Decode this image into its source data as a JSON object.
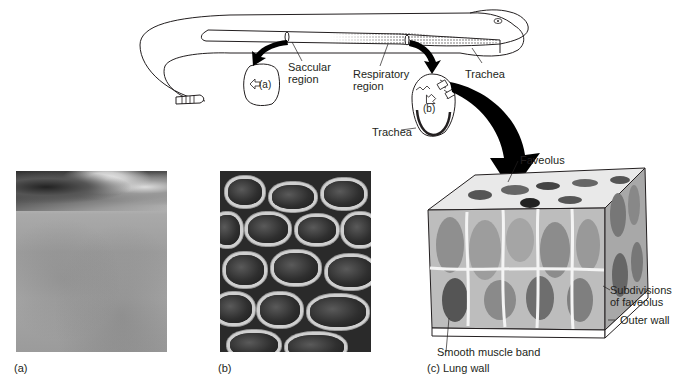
{
  "figure": {
    "top_diagram": {
      "labels": {
        "saccular_region": [
          "Saccular",
          "region"
        ],
        "respiratory_region": [
          "Respiratory",
          "region"
        ],
        "trachea_head": "Trachea",
        "trachea_lung": "Trachea",
        "section_a_marker": "(a)",
        "section_b_marker": "(b)"
      }
    },
    "lung_wall_block": {
      "labels": {
        "faveolus": "Faveolus",
        "subdivisions": [
          "Subdivisions",
          "of faveolus"
        ],
        "outer_wall": "Outer wall",
        "smooth_muscle_band": "Smooth muscle band"
      }
    },
    "panels": [
      {
        "id": "a",
        "caption": "(a)"
      },
      {
        "id": "b",
        "caption": "(b)"
      },
      {
        "id": "c",
        "caption": "(c) Lung wall"
      }
    ],
    "colors": {
      "line": "#231f20",
      "background": "#ffffff",
      "arrow": "#000000"
    }
  }
}
